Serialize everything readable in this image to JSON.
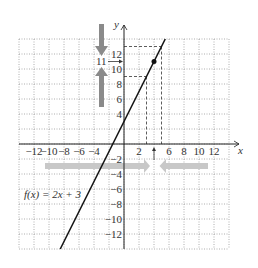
{
  "chart_data": {
    "type": "line",
    "title": "",
    "function_label": "f(x) = 2x + 3",
    "xlabel": "x",
    "ylabel": "y",
    "xlim": [
      -14,
      14
    ],
    "ylim": [
      -14,
      14
    ],
    "grid": true,
    "x_ticks": [
      -12,
      -10,
      -8,
      -6,
      -4,
      2,
      6,
      8,
      10,
      12
    ],
    "y_ticks": [
      12,
      10,
      8,
      6,
      4,
      -2,
      -4,
      -6,
      -8,
      -10,
      -12
    ],
    "tick_labels": {
      "x": [
        "-12",
        "-10",
        "-8",
        "-6",
        "-4",
        "2",
        "6",
        "8",
        "10",
        "12"
      ],
      "y": [
        "12",
        "10",
        "8",
        "6",
        "4",
        "-2",
        "-4",
        "-6",
        "-8",
        "-10",
        "-12"
      ]
    },
    "series": [
      {
        "name": "f(x) = 2x + 3",
        "slope": 2,
        "intercept": 3,
        "x": [
          -8.5,
          5.5
        ],
        "y": [
          -14,
          14
        ]
      }
    ],
    "highlight_point": {
      "x": 4,
      "y": 11
    },
    "dashed_guides": [
      {
        "x_range": [
          3,
          5
        ],
        "y_range": [
          9,
          13
        ]
      }
    ],
    "annotations": [
      {
        "text": "11",
        "position": "left of y-axis at y=11",
        "arrow": "right"
      },
      {
        "text": "",
        "description": "vertical gray arrows converging toward y=11 on the left"
      },
      {
        "text": "",
        "description": "horizontal gray arrows converging toward x=4 below the x-axis"
      },
      {
        "text": "",
        "description": "small up arrow at x=4 pointing to axis"
      }
    ]
  },
  "labels": {
    "x_axis": "x",
    "y_axis": "y",
    "func": "f(x) = 2x + 3",
    "eleven": "11"
  }
}
